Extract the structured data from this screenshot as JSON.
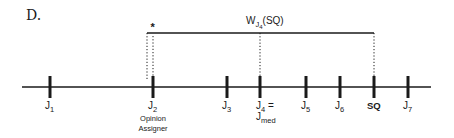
{
  "panel_label": "D.",
  "bracket": {
    "label_main": "W",
    "label_sub": "J",
    "label_subsub": "4",
    "label_arg": "(SQ)",
    "marker": "*"
  },
  "colors": {
    "ink": "#1a1a1a",
    "background": "#ffffff"
  },
  "axis": {
    "ticks": [
      {
        "id": "J1",
        "main": "J",
        "sub": "1",
        "x": 50
      },
      {
        "id": "J2",
        "main": "J",
        "sub": "2",
        "x": 153,
        "note_lines": [
          "Opinion",
          "Assigner"
        ]
      },
      {
        "id": "J3",
        "main": "J",
        "sub": "3",
        "x": 227
      },
      {
        "id": "J4",
        "main": "J",
        "sub": "4",
        "suffix": " =",
        "x": 260,
        "second_main": "J",
        "second_sub": "med"
      },
      {
        "id": "J5",
        "main": "J",
        "sub": "5",
        "x": 306
      },
      {
        "id": "J6",
        "main": "J",
        "sub": "6",
        "x": 340
      },
      {
        "id": "SQ",
        "main": "SQ",
        "sub": "",
        "bold": true,
        "x": 374
      },
      {
        "id": "J7",
        "main": "J",
        "sub": "7",
        "x": 408
      }
    ]
  }
}
